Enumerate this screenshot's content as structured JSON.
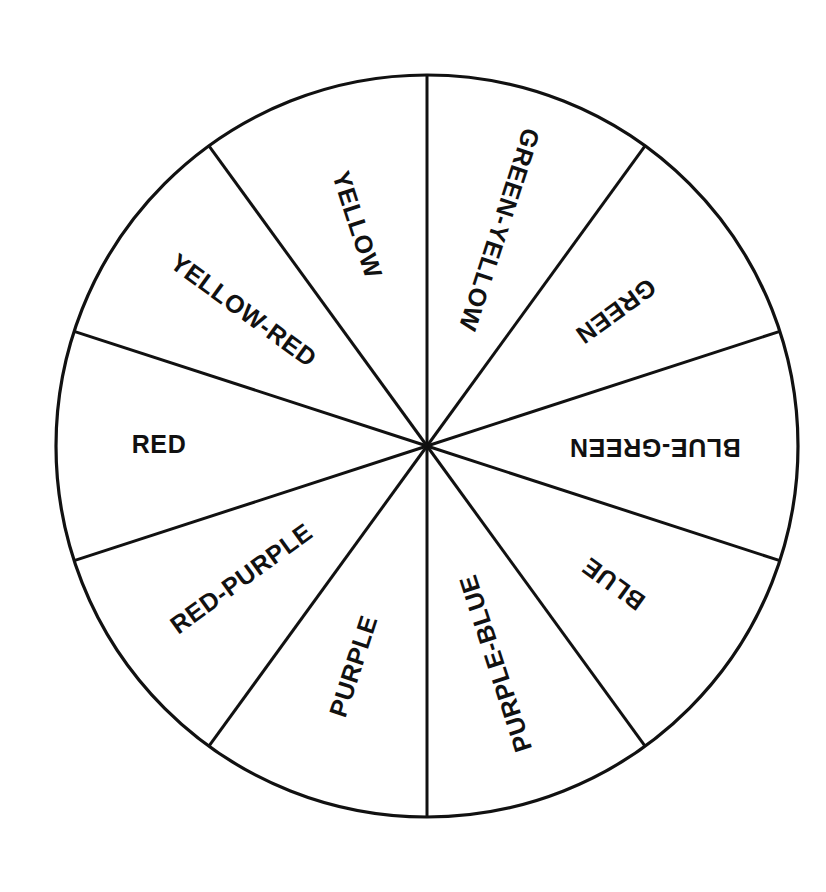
{
  "figure": {
    "name": "color-wheel",
    "type": "pie",
    "background_color": "#ffffff",
    "line_color": "#111111",
    "text_color": "#111111",
    "center_x": 427,
    "center_y": 446,
    "radius": 371,
    "sector_count": 10,
    "sector_angle_degrees": 36
  },
  "chart_data": {
    "type": "pie",
    "title": "",
    "subtitle": "",
    "xlabel": "",
    "ylabel": "",
    "legend": "none",
    "grid": false,
    "equal_slices": true,
    "slice_angle_deg": 36,
    "categories": [
      "GREEN-YELLOW",
      "GREEN",
      "BLUE-GREEN",
      "BLUE",
      "PURPLE-BLUE",
      "PURPLE",
      "RED-PURPLE",
      "RED",
      "YELLOW-RED",
      "YELLOW"
    ],
    "values": [
      36,
      36,
      36,
      36,
      36,
      36,
      36,
      36,
      36,
      36
    ],
    "annotations": []
  },
  "sectors": [
    {
      "label": "GREEN-YELLOW",
      "name": "sector-green-yellow",
      "start_deg": 0,
      "end_deg": 36,
      "mid_deg": 18,
      "label_radius": 228,
      "label_rotation": 108,
      "label_anchor": "middle"
    },
    {
      "label": "GREEN",
      "name": "sector-green",
      "start_deg": 36,
      "end_deg": 72,
      "mid_deg": 54,
      "label_radius": 232,
      "label_rotation": 144,
      "label_anchor": "middle"
    },
    {
      "label": "BLUE-GREEN",
      "name": "sector-blue-green",
      "start_deg": 72,
      "end_deg": 108,
      "mid_deg": 90,
      "label_radius": 228,
      "label_rotation": 180,
      "label_anchor": "middle"
    },
    {
      "label": "BLUE",
      "name": "sector-blue",
      "start_deg": 108,
      "end_deg": 144,
      "mid_deg": 126,
      "label_radius": 232,
      "label_rotation": 216,
      "label_anchor": "middle"
    },
    {
      "label": "PURPLE-BLUE",
      "name": "sector-purple-blue",
      "start_deg": 144,
      "end_deg": 180,
      "mid_deg": 162,
      "label_radius": 228,
      "label_rotation": 252,
      "label_anchor": "middle"
    },
    {
      "label": "PURPLE",
      "name": "sector-purple",
      "start_deg": 180,
      "end_deg": 216,
      "mid_deg": 198,
      "label_radius": 232,
      "label_rotation": 288,
      "label_anchor": "middle"
    },
    {
      "label": "RED-PURPLE",
      "name": "sector-red-purple",
      "start_deg": 216,
      "end_deg": 252,
      "mid_deg": 234,
      "label_radius": 228,
      "label_rotation": 324,
      "label_anchor": "middle"
    },
    {
      "label": "RED",
      "name": "sector-red",
      "start_deg": 252,
      "end_deg": 288,
      "mid_deg": 270,
      "label_radius": 268,
      "label_rotation": 0,
      "label_anchor": "middle"
    },
    {
      "label": "YELLOW-RED",
      "name": "sector-yellow-red",
      "start_deg": 288,
      "end_deg": 324,
      "mid_deg": 306,
      "label_radius": 228,
      "label_rotation": 36,
      "label_anchor": "middle"
    },
    {
      "label": "YELLOW",
      "name": "sector-yellow",
      "start_deg": 324,
      "end_deg": 360,
      "mid_deg": 342,
      "label_radius": 232,
      "label_rotation": 72,
      "label_anchor": "middle"
    }
  ]
}
